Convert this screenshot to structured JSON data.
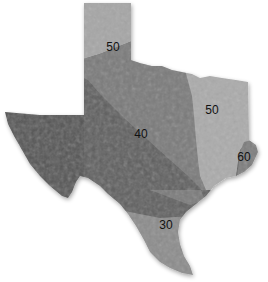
{
  "map": {
    "region": "Texas",
    "style": "grayscale shaded relief",
    "zones": [
      {
        "id": "zone-30",
        "value": "30",
        "color": "#8c8c8c"
      },
      {
        "id": "zone-40",
        "value": "40",
        "color": "#5e5e5e"
      },
      {
        "id": "zone-50-west",
        "value": "50",
        "color": "#7a7a7a"
      },
      {
        "id": "zone-50-panhandle",
        "value": "50",
        "color": "#a6a6a6"
      },
      {
        "id": "zone-50-east",
        "value": "50",
        "color": "#ababab"
      },
      {
        "id": "zone-60",
        "value": "60",
        "color": "#7d7d7d"
      }
    ],
    "labels": [
      {
        "text": "50",
        "x": 113,
        "y": 51
      },
      {
        "text": "50",
        "x": 212,
        "y": 114
      },
      {
        "text": "40",
        "x": 141,
        "y": 138
      },
      {
        "text": "60",
        "x": 244,
        "y": 161
      },
      {
        "text": "30",
        "x": 166,
        "y": 229
      }
    ]
  }
}
